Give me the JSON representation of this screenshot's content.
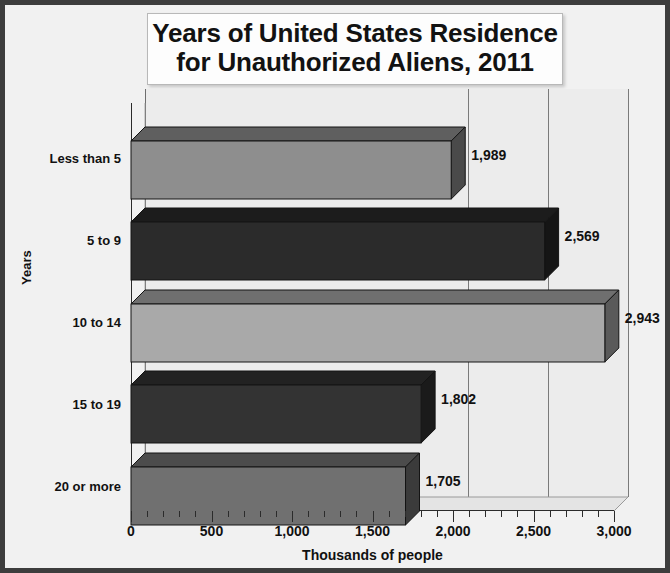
{
  "chart_data": {
    "type": "bar",
    "orientation": "horizontal",
    "title": "Years of United States Residence for Unauthorized Aliens, 2011",
    "title_lines": [
      "Years of United States Residence",
      "for Unauthorized Aliens, 2011"
    ],
    "categories": [
      "Less than 5",
      "5 to 9",
      "10 to 14",
      "15 to 19",
      "20 or more"
    ],
    "values": [
      1989,
      2569,
      2943,
      1802,
      1705
    ],
    "value_labels": [
      "1,989",
      "2,569",
      "2,943",
      "1,802",
      "1,705"
    ],
    "xlabel": "Thousands of people",
    "ylabel": "Years",
    "xlim": [
      0,
      3000
    ],
    "xticks": [
      0,
      500,
      1000,
      1500,
      2000,
      2500,
      3000
    ],
    "xtick_labels": [
      "0",
      "500",
      "1,000",
      "1,500",
      "2,000",
      "2,500",
      "3,000"
    ],
    "xminor_step": 100,
    "grid": "vertical-major",
    "legend": "none",
    "style": "3d-bar",
    "bar_colors": [
      "#8e8e8e",
      "#2b2b2b",
      "#a9a9a9",
      "#333333",
      "#707070"
    ],
    "bar_top_colors": [
      "#5f5f5f",
      "#1c1c1c",
      "#6f6f6f",
      "#222222",
      "#4c4c4c"
    ],
    "bar_side_colors": [
      "#4a4a4a",
      "#151515",
      "#5a5a5a",
      "#1a1a1a",
      "#3b3b3b"
    ]
  },
  "colors": {
    "frame": "#3d3d3d",
    "background": "#f1f1f1",
    "wall": "#ececec",
    "axis": "#2b2b2b",
    "gridline": "#7a7a7a",
    "text": "#111111"
  }
}
